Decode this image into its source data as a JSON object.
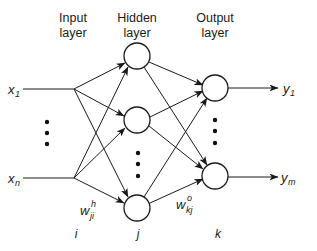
{
  "diagram": {
    "type": "feedforward-neural-network",
    "layers": {
      "input": {
        "title_line1": "Input",
        "title_line2": "layer",
        "index": "i"
      },
      "hidden": {
        "title_line1": "Hidden",
        "title_line2": "layer",
        "index": "j"
      },
      "output": {
        "title_line1": "Output",
        "title_line2": "layer",
        "index": "k"
      }
    },
    "inputs": [
      {
        "base": "x",
        "sub": "1"
      },
      {
        "base": "x",
        "sub": "n"
      }
    ],
    "outputs": [
      {
        "base": "y",
        "sub": "1"
      },
      {
        "base": "y",
        "sub": "m"
      }
    ],
    "weights": {
      "hidden": {
        "base": "w",
        "sub": "ji",
        "sup": "h"
      },
      "output": {
        "base": "w",
        "sub": "kj",
        "sup": "o"
      }
    },
    "ellipsis": "⋮",
    "colors": {
      "stroke": "#1a1a1a",
      "background": "#ffffff"
    }
  }
}
